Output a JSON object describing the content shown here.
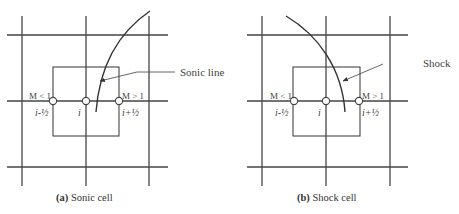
{
  "panels": [
    {
      "id": "a",
      "caption_prefix": "(a)",
      "caption_text": " Sonic cell",
      "callout": "Sonic line",
      "left_face_mach": "M < 1",
      "right_face_mach": "M > 1",
      "left_face_index": "i-½",
      "center_index": "i",
      "right_face_index": "i+½"
    },
    {
      "id": "b",
      "caption_prefix": "(b)",
      "caption_text": " Shock cell",
      "callout": "Shock",
      "left_face_mach": "M < 1",
      "right_face_mach": "M > 1",
      "left_face_index": "i-½",
      "center_index": "i",
      "right_face_index": "i+½"
    }
  ],
  "colors": {
    "line": "#444444",
    "background": "#ffffff"
  }
}
